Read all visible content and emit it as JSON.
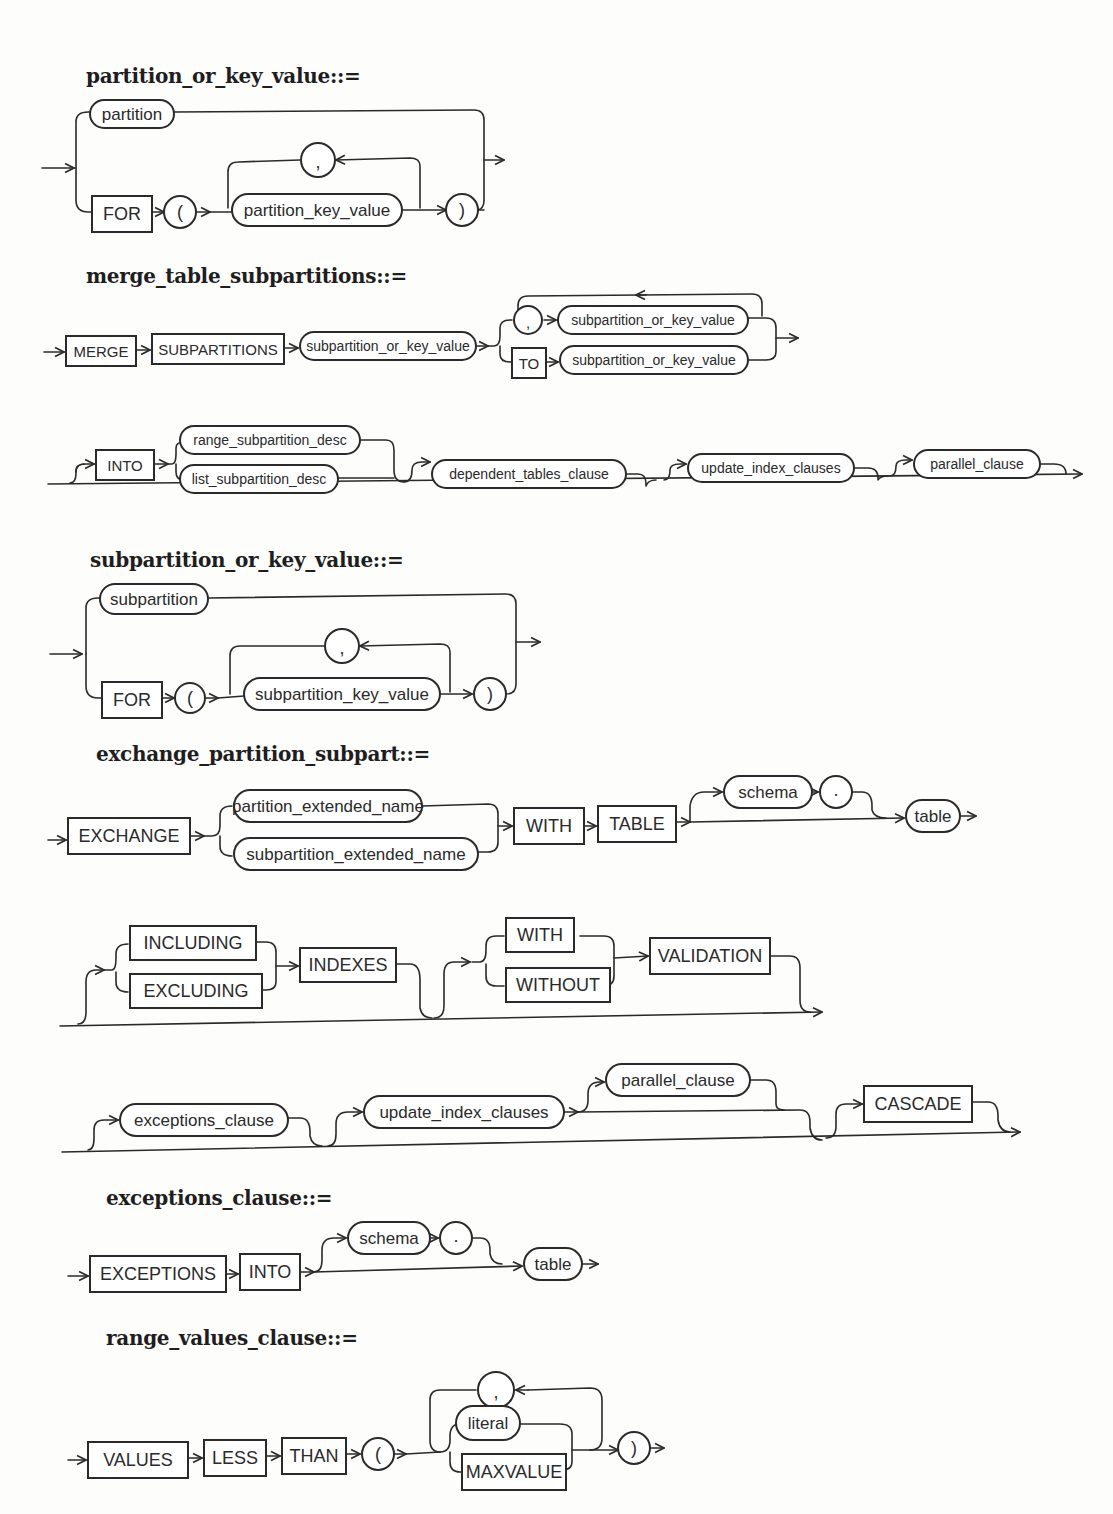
{
  "diagrams": {
    "partition_or_key_value": {
      "title": "partition_or_key_value::=",
      "nodes": {
        "partition": "partition",
        "for": "FOR",
        "lparen": "(",
        "comma": ",",
        "partition_key_value": "partition_key_value",
        "rparen": ")"
      }
    },
    "merge_table_subpartitions": {
      "title": "merge_table_subpartitions::=",
      "nodes": {
        "merge": "MERGE",
        "subpartitions": "SUBPARTITIONS",
        "subpartition_or_key_value_1": "subpartition_or_key_value",
        "comma": ",",
        "subpartition_or_key_value_2": "subpartition_or_key_value",
        "to": "TO",
        "subpartition_or_key_value_3": "subpartition_or_key_value",
        "into": "INTO",
        "range_subpartition_desc": "range_subpartition_desc",
        "list_subpartition_desc": "list_subpartition_desc",
        "dependent_tables_clause": "dependent_tables_clause",
        "update_index_clauses": "update_index_clauses",
        "parallel_clause": "parallel_clause"
      }
    },
    "subpartition_or_key_value": {
      "title": "subpartition_or_key_value::=",
      "nodes": {
        "subpartition": "subpartition",
        "for": "FOR",
        "lparen": "(",
        "comma": ",",
        "subpartition_key_value": "subpartition_key_value",
        "rparen": ")"
      }
    },
    "exchange_partition_subpart": {
      "title": "exchange_partition_subpart::=",
      "nodes": {
        "exchange": "EXCHANGE",
        "partition_extended_name": "partition_extended_name",
        "subpartition_extended_name": "subpartition_extended_name",
        "with": "WITH",
        "table_kw": "TABLE",
        "schema": "schema",
        "dot": ".",
        "table": "table",
        "including": "INCLUDING",
        "excluding": "EXCLUDING",
        "indexes": "INDEXES",
        "with2": "WITH",
        "without": "WITHOUT",
        "validation": "VALIDATION",
        "exceptions_clause": "exceptions_clause",
        "update_index_clauses": "update_index_clauses",
        "parallel_clause": "parallel_clause",
        "cascade": "CASCADE"
      }
    },
    "exceptions_clause": {
      "title": "exceptions_clause::=",
      "nodes": {
        "exceptions": "EXCEPTIONS",
        "into": "INTO",
        "schema": "schema",
        "dot": ".",
        "table": "table"
      }
    },
    "range_values_clause": {
      "title": "range_values_clause::=",
      "nodes": {
        "values": "VALUES",
        "less": "LESS",
        "than": "THAN",
        "lparen": "(",
        "comma": ",",
        "literal": "literal",
        "maxvalue": "MAXVALUE",
        "rparen": ")"
      }
    }
  }
}
